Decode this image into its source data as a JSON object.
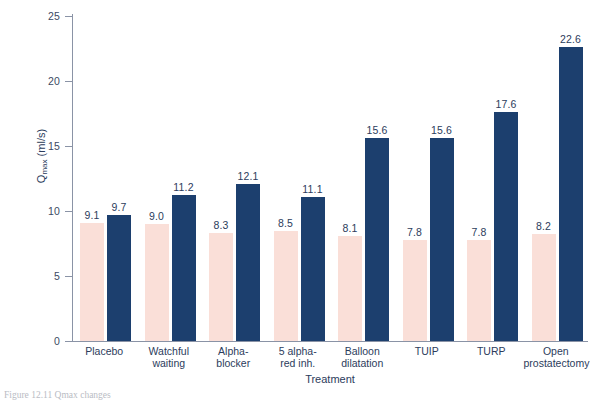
{
  "chart_data": {
    "type": "bar",
    "title": "",
    "xlabel": "Treatment",
    "ylabel": "Qmax (ml/s)",
    "ylabel_base": "Q",
    "ylabel_sub": "max",
    "ylabel_unit": " (ml/s)",
    "ylim": [
      0,
      25
    ],
    "yticks": [
      0,
      5,
      10,
      15,
      20,
      25
    ],
    "ytick_labels": [
      "0",
      "5",
      "10",
      "15",
      "20",
      "25"
    ],
    "grid": false,
    "legend": "none",
    "categories": [
      "Placebo",
      "Watchful waiting",
      "Alpha-blocker",
      "5 alpha-red inh.",
      "Balloon dilatation",
      "TUIP",
      "TURP",
      "Open prostatectomy"
    ],
    "category_lines": [
      [
        "Placebo"
      ],
      [
        "Watchful",
        "waiting"
      ],
      [
        "Alpha-",
        "blocker"
      ],
      [
        "5 alpha-",
        "red inh."
      ],
      [
        "Balloon",
        "dilatation"
      ],
      [
        "TUIP"
      ],
      [
        "TURP"
      ],
      [
        "Open",
        "prostatectomy"
      ]
    ],
    "series": [
      {
        "name": "pre-treatment",
        "color": "#fadfd8",
        "values": [
          9.1,
          9.0,
          8.3,
          8.5,
          8.1,
          7.8,
          7.8,
          8.2
        ],
        "labels": [
          "9.1",
          "9.0",
          "8.3",
          "8.5",
          "8.1",
          "7.8",
          "7.8",
          "8.2"
        ]
      },
      {
        "name": "post-treatment",
        "color": "#1c3f6e",
        "values": [
          9.7,
          11.2,
          12.1,
          11.1,
          15.6,
          15.6,
          17.6,
          22.6
        ],
        "labels": [
          "9.7",
          "11.2",
          "12.1",
          "11.1",
          "15.6",
          "15.6",
          "17.6",
          "22.6"
        ]
      }
    ]
  },
  "caption": {
    "text": "Figure 12.11  Qmax changes"
  },
  "colors": {
    "pre_bar": "#fadfd8",
    "post_bar": "#1c3f6e",
    "axis": "#8a93a6",
    "text": "#2c3c5c"
  }
}
